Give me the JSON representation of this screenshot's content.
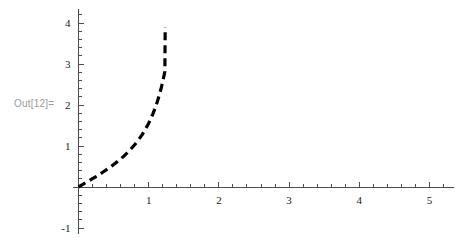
{
  "output_label": "Out[12]=",
  "colors": {
    "curve": "#000000",
    "axis": "#4d4d4d",
    "tick_label": "#1a1a1a",
    "out_label": "#9a9a9a",
    "background": "#ffffff"
  },
  "chart_data": {
    "type": "line",
    "title": "",
    "xlabel": "",
    "ylabel": "",
    "xlim": [
      -0.08,
      5.35
    ],
    "ylim": [
      -1.15,
      4.35
    ],
    "grid": false,
    "legend": null,
    "axes_style": "crossing-at-origin",
    "line_style": "dashed",
    "line_width_px": 3.2,
    "dash_pattern": "8 5",
    "xticks": [
      1,
      2,
      3,
      4,
      5
    ],
    "xtick_labels": [
      "1",
      "2",
      "3",
      "4",
      "5"
    ],
    "x_minor_ticks": [
      0.2,
      0.4,
      0.6,
      0.8,
      1.2,
      1.4,
      1.6,
      1.8,
      2.2,
      2.4,
      2.6,
      2.8,
      3.2,
      3.4,
      3.6,
      3.8,
      4.2,
      4.4,
      4.6,
      4.8,
      5.2
    ],
    "yticks": [
      -1,
      1,
      2,
      3,
      4
    ],
    "ytick_labels": [
      "-1",
      "1",
      "2",
      "3",
      "4"
    ],
    "y_minor_ticks": [
      -0.8,
      -0.6,
      -0.4,
      -0.2,
      0.2,
      0.4,
      0.6,
      0.8,
      1.2,
      1.4,
      1.6,
      1.8,
      2.2,
      2.4,
      2.6,
      2.8,
      3.2,
      3.4,
      3.6,
      3.8,
      4.2
    ],
    "series": [
      {
        "name": "tan(x)",
        "x": [
          0.0,
          0.05,
          0.1,
          0.15,
          0.2,
          0.25,
          0.3,
          0.35,
          0.4,
          0.45,
          0.5,
          0.55,
          0.6,
          0.65,
          0.7,
          0.75,
          0.8,
          0.85,
          0.9,
          0.95,
          1.0,
          1.03,
          1.06,
          1.09,
          1.12,
          1.15,
          1.18,
          1.2,
          1.21,
          1.22,
          1.23,
          1.235
        ],
        "y": [
          0.0,
          0.05,
          0.1,
          0.151,
          0.203,
          0.255,
          0.309,
          0.365,
          0.423,
          0.483,
          0.546,
          0.613,
          0.684,
          0.76,
          0.842,
          0.932,
          1.03,
          1.138,
          1.26,
          1.398,
          1.557,
          1.665,
          1.784,
          1.917,
          2.066,
          2.234,
          2.427,
          2.572,
          2.65,
          2.733,
          2.82,
          3.9
        ]
      }
    ]
  }
}
